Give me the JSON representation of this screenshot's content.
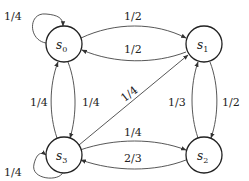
{
  "diagram": {
    "type": "state-transition-diagram",
    "nodes": [
      {
        "id": "s0",
        "label": "s",
        "sub": "0"
      },
      {
        "id": "s1",
        "label": "s",
        "sub": "1"
      },
      {
        "id": "s2",
        "label": "s",
        "sub": "2"
      },
      {
        "id": "s3",
        "label": "s",
        "sub": "3"
      }
    ],
    "edges": [
      {
        "from": "s0",
        "to": "s0",
        "label": "1/4"
      },
      {
        "from": "s0",
        "to": "s1",
        "label": "1/2"
      },
      {
        "from": "s1",
        "to": "s0",
        "label": "1/2"
      },
      {
        "from": "s3",
        "to": "s0",
        "label": "1/4"
      },
      {
        "from": "s0",
        "to": "s3",
        "label": "1/4"
      },
      {
        "from": "s3",
        "to": "s1",
        "label": "1/4"
      },
      {
        "from": "s2",
        "to": "s1",
        "label": "1/3"
      },
      {
        "from": "s1",
        "to": "s2",
        "label": "1/2"
      },
      {
        "from": "s3",
        "to": "s2",
        "label": "1/4"
      },
      {
        "from": "s2",
        "to": "s3",
        "label": "2/3"
      },
      {
        "from": "s3",
        "to": "s3",
        "label": "1/4"
      }
    ]
  }
}
